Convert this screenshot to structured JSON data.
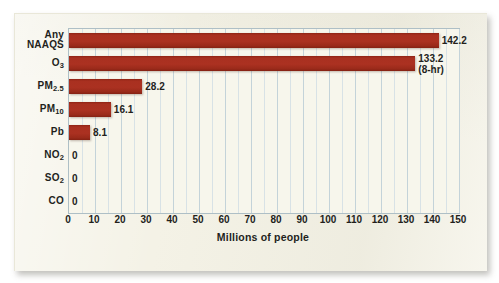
{
  "chart_data": {
    "type": "bar",
    "orientation": "horizontal",
    "title": "",
    "xlabel": "Millions of people",
    "ylabel": "",
    "xlim": [
      0,
      150
    ],
    "xticks": [
      0,
      10,
      20,
      30,
      40,
      50,
      60,
      70,
      80,
      90,
      100,
      110,
      120,
      130,
      140,
      150
    ],
    "grid": true,
    "legend": "none",
    "categories": [
      "Any NAAQS",
      "O3",
      "PM2.5",
      "PM10",
      "Pb",
      "NO2",
      "SO2",
      "CO"
    ],
    "values": [
      142.2,
      133.2,
      28.2,
      16.1,
      8.1,
      0,
      0,
      0
    ],
    "value_labels": [
      "142.2",
      "133.2",
      "28.2",
      "16.1",
      "8.1",
      "0",
      "0",
      "0"
    ],
    "annotations": [
      {
        "category": "O3",
        "text": "(8-hr)"
      }
    ],
    "bar_color": "#a93020",
    "plot_background": "#f7f6ec",
    "gridline_color": "#c4d3d9",
    "page_background": "#f4f2e6",
    "text_color": "#231f1c"
  },
  "categories_display": [
    {
      "main": "Any",
      "second": "NAAQS",
      "sub": ""
    },
    {
      "main": "O",
      "second": "",
      "sub": "3"
    },
    {
      "main": "PM",
      "second": "",
      "sub": "2.5"
    },
    {
      "main": "PM",
      "second": "",
      "sub": "10"
    },
    {
      "main": "Pb",
      "second": "",
      "sub": ""
    },
    {
      "main": "NO",
      "second": "",
      "sub": "2"
    },
    {
      "main": "SO",
      "second": "",
      "sub": "2"
    },
    {
      "main": "CO",
      "second": "",
      "sub": ""
    }
  ]
}
